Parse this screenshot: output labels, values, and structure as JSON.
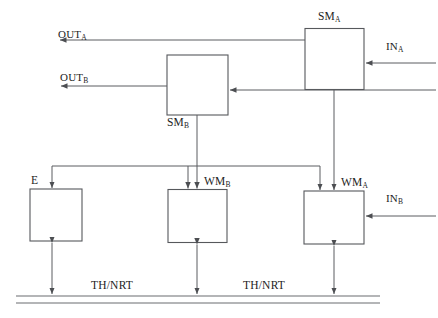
{
  "diagram": {
    "colors": {
      "line": "#5a5c60",
      "box_stroke": "#56585c",
      "background": "#ffffff",
      "text": "#1d1d1d"
    },
    "blocks": [
      {
        "id": "sm_a",
        "name": "SM",
        "subscript": "A",
        "label": "SM_A"
      },
      {
        "id": "sm_b",
        "name": "SM",
        "subscript": "B",
        "label": "SM_B"
      },
      {
        "id": "e",
        "name": "E",
        "subscript": "",
        "label": "E"
      },
      {
        "id": "wm_b",
        "name": "WM",
        "subscript": "B",
        "label": "WM_B"
      },
      {
        "id": "wm_a",
        "name": "WM",
        "subscript": "A",
        "label": "WM_A"
      }
    ],
    "ports": [
      {
        "id": "out_a",
        "name": "OUT",
        "subscript": "A",
        "direction": "output"
      },
      {
        "id": "out_b",
        "name": "OUT",
        "subscript": "B",
        "direction": "output"
      },
      {
        "id": "in_a",
        "name": "IN",
        "subscript": "A",
        "direction": "input"
      },
      {
        "id": "in_b",
        "name": "IN",
        "subscript": "B",
        "direction": "input"
      }
    ],
    "buses": [
      {
        "id": "th_nrt_left",
        "label": "TH/NRT"
      },
      {
        "id": "th_nrt_right",
        "label": "TH/NRT"
      }
    ]
  }
}
